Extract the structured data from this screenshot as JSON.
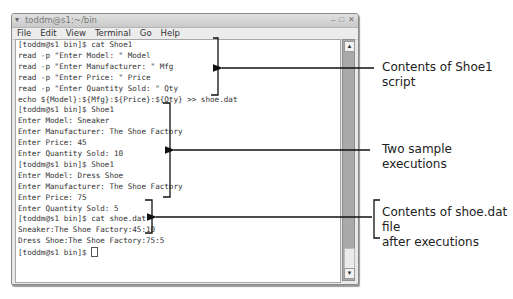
{
  "window": {
    "title": "toddm@s1:~/bin",
    "menu_icon": "▾",
    "controls": {
      "minimize": "–",
      "maximize": "□",
      "close": "✕"
    },
    "menu": [
      {
        "label": "File"
      },
      {
        "label": "Edit"
      },
      {
        "label": "View"
      },
      {
        "label": "Terminal"
      },
      {
        "label": "Go"
      },
      {
        "label": "Help"
      }
    ]
  },
  "terminal": {
    "lines": [
      "[toddm@s1 bin]$ cat Shoe1",
      "read -p \"Enter Model: \" Model",
      "read -p \"Enter Manufacturer: \" Mfg",
      "read -p \"Enter Price: \" Price",
      "read -p \"Enter Quantity Sold: \" Qty",
      "echo ${Model}:${Mfg}:${Price}:${Qty} >> shoe.dat",
      "[toddm@s1 bin]$ Shoe1",
      "Enter Model: Sneaker",
      "Enter Manufacturer: The Shoe Factory",
      "Enter Price: 45",
      "Enter Quantity Sold: 10",
      "[toddm@s1 bin]$ Shoe1",
      "Enter Model: Dress Shoe",
      "Enter Manufacturer: The Shoe Factory",
      "Enter Price: 75",
      "Enter Quantity Sold: 5",
      "[toddm@s1 bin]$ cat shoe.dat",
      "Sneaker:The Shoe Factory:45:10",
      "Dress Shoe:The Shoe Factory:75:5",
      "[toddm@s1 bin]$ "
    ]
  },
  "scrollbar": {
    "up_arrow": "▲",
    "down_arrow": "▼"
  },
  "callouts": [
    {
      "text": "Contents of Shoe1 script"
    },
    {
      "text": "Two sample executions"
    },
    {
      "line1": "Contents of shoe.dat file",
      "line2": "after executions"
    }
  ]
}
